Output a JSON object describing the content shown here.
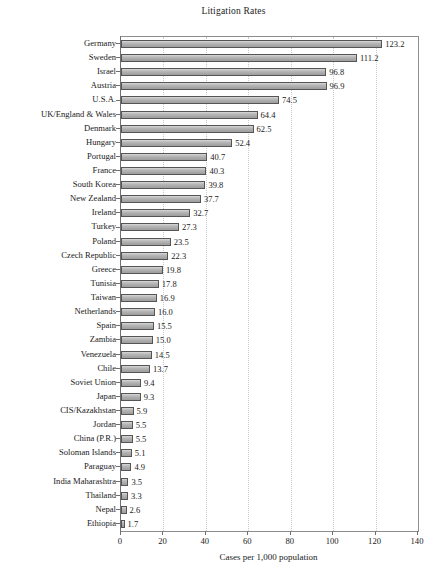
{
  "chart_data": {
    "type": "bar",
    "orientation": "horizontal",
    "title": "Litigation Rates",
    "xlabel": "Cases per 1,000 population",
    "ylabel": "",
    "xlim": [
      0,
      140
    ],
    "xticks": [
      0,
      20,
      40,
      60,
      80,
      100,
      120,
      140
    ],
    "grid": "vertical-dotted",
    "legend": null,
    "categories": [
      "Germany",
      "Sweden",
      "Israel",
      "Austria",
      "U.S.A.",
      "UK/England & Wales",
      "Denmark",
      "Hungary",
      "Portugal",
      "France",
      "South Korea",
      "New Zealand",
      "Ireland",
      "Turkey",
      "Poland",
      "Czech Republic",
      "Greece",
      "Tunisia",
      "Taiwan",
      "Netherlands",
      "Spain",
      "Zambia",
      "Venezuela",
      "Chile",
      "Soviet Union",
      "Japan",
      "CIS/Kazakhstan",
      "Jordan",
      "China (P.R.)",
      "Soloman Islands",
      "Paraguay",
      "India Maharashtra",
      "Thailand",
      "Nepal",
      "Ethiopia"
    ],
    "values": [
      123.2,
      111.2,
      96.8,
      96.9,
      74.5,
      64.4,
      62.5,
      52.4,
      40.7,
      40.3,
      39.8,
      37.7,
      32.7,
      27.3,
      23.5,
      22.3,
      19.8,
      17.8,
      16.9,
      16.0,
      15.5,
      15.0,
      14.5,
      13.7,
      9.4,
      9.3,
      5.9,
      5.5,
      5.5,
      5.1,
      4.9,
      3.5,
      3.3,
      2.6,
      1.7
    ],
    "value_labels": [
      "123.2",
      "111.2",
      "96.8",
      "96.9",
      "74.5",
      "64.4",
      "62.5",
      "52.4",
      "40.7",
      "40.3",
      "39.8",
      "37.7",
      "32.7",
      "27.3",
      "23.5",
      "22.3",
      "19.8",
      "17.8",
      "16.9",
      "16.0",
      "15.5",
      "15.0",
      "14.5",
      "13.7",
      "9.4",
      "9.3",
      "5.9",
      "5.5",
      "5.5",
      "5.1",
      "4.9",
      "3.5",
      "3.3",
      "2.6",
      "1.7"
    ],
    "xtick_labels": [
      "0",
      "20",
      "40",
      "60",
      "80",
      "100",
      "120",
      "140"
    ],
    "colors": {
      "bar_fill": "#a9a9a9",
      "bar_border": "#555555",
      "grid": "#c9c9c9",
      "axis": "#6f6f6f",
      "text": "#1a1a1a",
      "background": "#ffffff"
    }
  }
}
